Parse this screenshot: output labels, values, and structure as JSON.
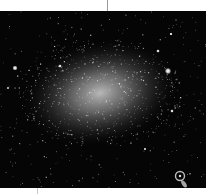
{
  "image": {
    "subject": "dwarf irregular galaxy star field",
    "background_color": "#050505",
    "glow_color": "#d8d8d8",
    "frame_color": "#ffffff",
    "galaxy": {
      "cx": 100,
      "cy": 82,
      "rx": 78,
      "ry": 52,
      "rotation": -12
    },
    "bright_stars": [
      {
        "x": 15,
        "y": 57,
        "r": 2.6
      },
      {
        "x": 168,
        "y": 60,
        "r": 3.2
      },
      {
        "x": 158,
        "y": 40,
        "r": 1.8
      },
      {
        "x": 171,
        "y": 23,
        "r": 1.6
      },
      {
        "x": 172,
        "y": 100,
        "r": 1.8
      },
      {
        "x": 60,
        "y": 55,
        "r": 1.8
      },
      {
        "x": 8,
        "y": 77,
        "r": 1.2
      },
      {
        "x": 145,
        "y": 138,
        "r": 1.3
      }
    ],
    "background_galaxy": {
      "x": 180,
      "y": 165,
      "r": 4.5
    }
  }
}
